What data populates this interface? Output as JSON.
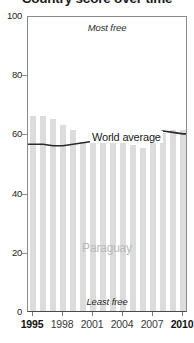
{
  "title": "Country score over time",
  "country": "Paraguay",
  "annotations": {
    "most_free": "Most free",
    "least_free": "Least free",
    "series_label": "World average"
  },
  "axis": {
    "y_ticks": [
      "100",
      "80",
      "60",
      "40",
      "20",
      "0"
    ],
    "x_ticks": [
      "1995",
      "1998",
      "2001",
      "2004",
      "2007",
      "2010"
    ]
  },
  "colors": {
    "bar": "#dcdcdc",
    "line": "#2b2b2b",
    "country_label": "#b9b9b9",
    "frame": "#8a8a8a"
  },
  "chart_data": {
    "type": "bar",
    "title": "Country score over time",
    "xlabel": "",
    "ylabel": "",
    "ylim": [
      0,
      100
    ],
    "grid": false,
    "legend": "inline",
    "categories": [
      "1995",
      "1996",
      "1997",
      "1998",
      "1999",
      "2000",
      "2001",
      "2002",
      "2003",
      "2004",
      "2005",
      "2006",
      "2007",
      "2008",
      "2009",
      "2010"
    ],
    "series": [
      {
        "name": "Paraguay",
        "type": "bar",
        "values": [
          66,
          66,
          65,
          63,
          61,
          57,
          57,
          57,
          58,
          58,
          56,
          55,
          58,
          60,
          61,
          61
        ]
      },
      {
        "name": "World average",
        "type": "line",
        "values": [
          57,
          57,
          56.5,
          56.5,
          57,
          57.5,
          58,
          59.5,
          60,
          60,
          60,
          60,
          60.5,
          61.5,
          61,
          60.5
        ]
      }
    ],
    "annotations": [
      "Most free",
      "Least free",
      "Paraguay",
      "World average"
    ]
  }
}
